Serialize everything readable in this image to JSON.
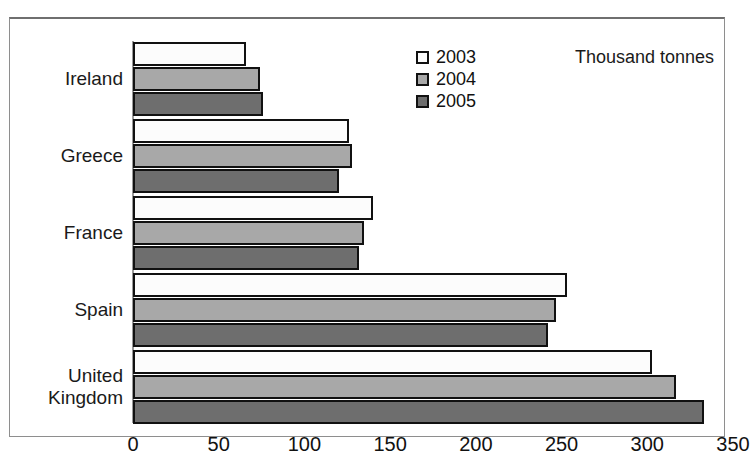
{
  "figure": {
    "cutoff_title_fragment": "",
    "unit_label": "Thousand tonnes"
  },
  "legend": {
    "position": "top-center",
    "items": [
      {
        "label": "2003",
        "color": "#fcfcfc"
      },
      {
        "label": "2004",
        "color": "#a8a8a8"
      },
      {
        "label": "2005",
        "color": "#6e6e6e"
      }
    ]
  },
  "axis": {
    "ticks": [
      "0",
      "50",
      "100",
      "150",
      "200",
      "250",
      "300",
      "350"
    ]
  },
  "chart_data": {
    "type": "bar",
    "orientation": "horizontal",
    "title": "",
    "subtitle": "",
    "xlabel": "Thousand tonnes",
    "ylabel": "",
    "xlim": [
      0,
      350
    ],
    "xticks": [
      0,
      50,
      100,
      150,
      200,
      250,
      300,
      350
    ],
    "grid": false,
    "legend_position": "top-center",
    "categories": [
      "Ireland",
      "Greece",
      "France",
      "Spain",
      "United Kingdom"
    ],
    "series": [
      {
        "name": "2003",
        "color": "#fcfcfc",
        "values": [
          66,
          126,
          140,
          253,
          303
        ]
      },
      {
        "name": "2004",
        "color": "#a8a8a8",
        "values": [
          74,
          128,
          135,
          247,
          317
        ]
      },
      {
        "name": "2005",
        "color": "#6e6e6e",
        "values": [
          76,
          120,
          132,
          242,
          333
        ]
      }
    ],
    "annotations": [
      "Thousand tonnes"
    ]
  }
}
